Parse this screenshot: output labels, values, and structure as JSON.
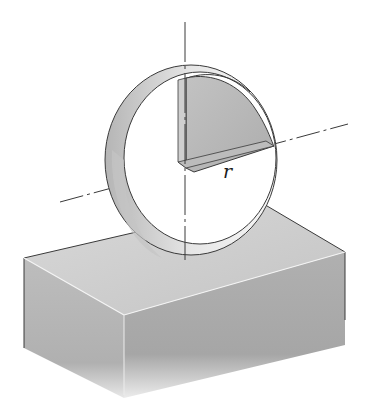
{
  "figure": {
    "labels": {
      "radius": "r"
    },
    "colors": {
      "background": "#ffffff",
      "ring_outer": "#e4e4e4",
      "ring_inner_band": "#bdbdbd",
      "section_fill": "#b8b8b8",
      "box_top": "#cfcfcf",
      "box_front_left": "#b5b5b5",
      "box_front_right": "#a9a9a9",
      "line": "#3a3a3a"
    }
  }
}
